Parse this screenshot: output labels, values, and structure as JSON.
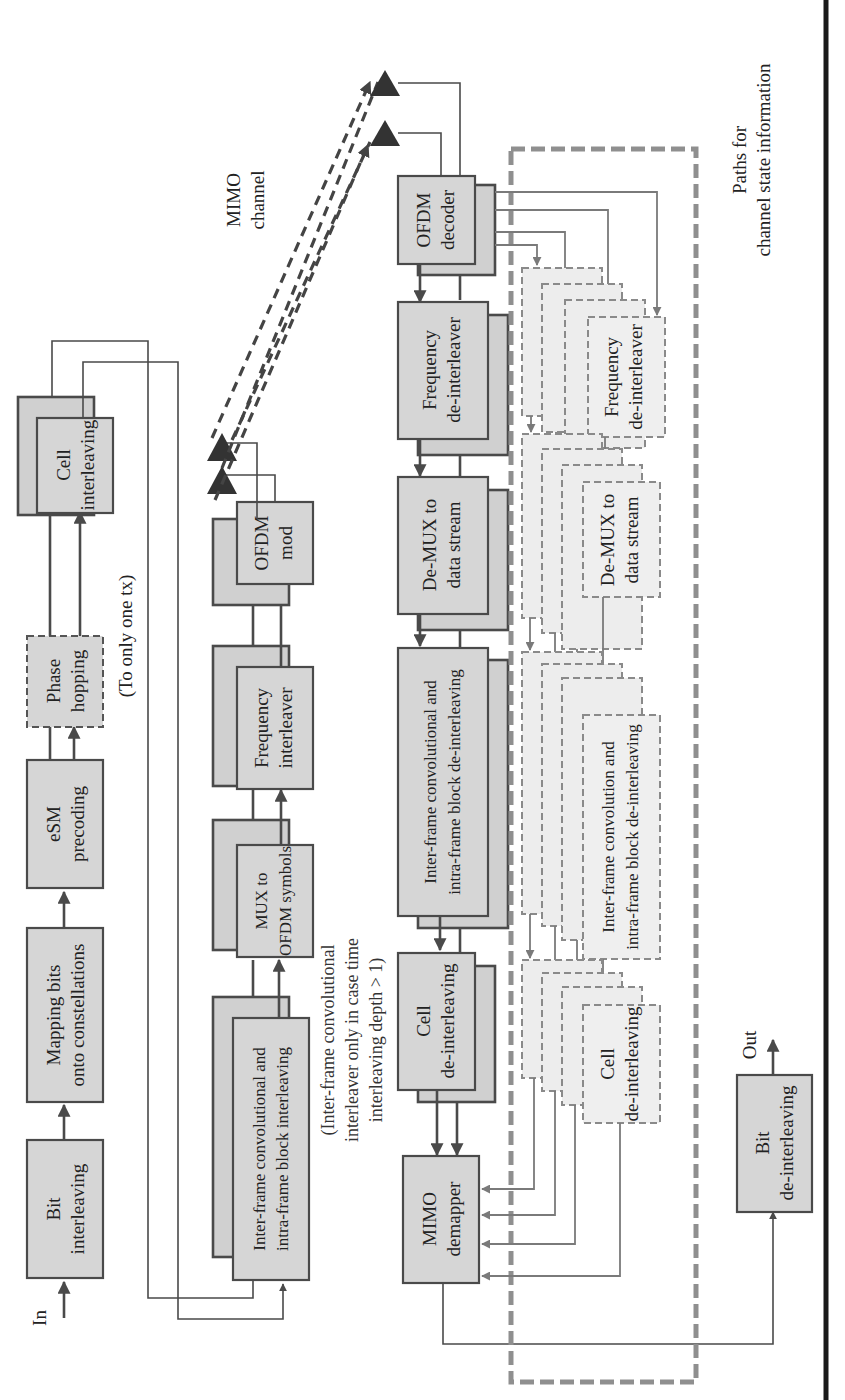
{
  "figure": {
    "orientation": "rotated-90-ccw",
    "transmitter": {
      "input_label": "In",
      "blocks": [
        {
          "id": "bit_interleaving",
          "line1": "Bit",
          "line2": "interleaving"
        },
        {
          "id": "mapping",
          "line1": "Mapping bits",
          "line2": "onto constellations"
        },
        {
          "id": "esm_precoding",
          "line1": "eSM",
          "line2": "precoding"
        },
        {
          "id": "phase_hopping",
          "line1": "Phase",
          "line2": "hopping",
          "style": "dashed"
        },
        {
          "id": "cell_interleaving",
          "line1": "Cell",
          "line2": "interleaving"
        },
        {
          "id": "inter_frame_tx",
          "line1": "Inter-frame convolutional and",
          "line2": "intra-frame block interleaving"
        },
        {
          "id": "mux_ofdm",
          "line1": "MUX to",
          "line2": "OFDM symbols"
        },
        {
          "id": "freq_interleaver",
          "line1": "Frequency",
          "line2": "interleaver"
        },
        {
          "id": "ofdm_mod",
          "line1": "OFDM",
          "line2": "mod"
        }
      ],
      "phase_hopping_note": "(To only one tx)",
      "inter_frame_note": {
        "line1": "(Inter-frame convolutional",
        "line2": "interleaver only in case time",
        "line3": "interleaving depth > 1)"
      }
    },
    "channel": {
      "line1": "MIMO",
      "line2": "channel"
    },
    "receiver": {
      "blocks": [
        {
          "id": "ofdm_decoder",
          "line1": "OFDM",
          "line2": "decoder"
        },
        {
          "id": "freq_deinterleaver",
          "line1": "Frequency",
          "line2": "de-interleaver"
        },
        {
          "id": "demux",
          "line1": "De-MUX to",
          "line2": "data stream"
        },
        {
          "id": "inter_frame_rx",
          "line1": "Inter-frame convolutional and",
          "line2": "intra-frame block de-interleaving"
        },
        {
          "id": "cell_deinterleaving",
          "line1": "Cell",
          "line2": "de-interleaving"
        },
        {
          "id": "mimo_demapper",
          "line1": "MIMO",
          "line2": "demapper"
        },
        {
          "id": "bit_deinterleaving",
          "line1": "Bit",
          "line2": "de-interleaving"
        }
      ],
      "output_label": "Out"
    },
    "csi": {
      "blocks": [
        {
          "id": "csi_freq",
          "line1": "Frequency",
          "line2": "de-interleaver"
        },
        {
          "id": "csi_demux",
          "line1": "De-MUX to",
          "line2": "data stream"
        },
        {
          "id": "csi_inter",
          "line1": "Inter-frame convolution and",
          "line2": "intra-frame block de-interleaving"
        },
        {
          "id": "csi_cell",
          "line1": "Cell",
          "line2": "de-interleaving"
        }
      ],
      "label": {
        "line1": "Paths for",
        "line2": "channel state information"
      }
    },
    "colors": {
      "block_fill": "#d6d6d6",
      "block_stroke": "#4a4a4a",
      "csi_fill": "#ededed",
      "csi_stroke": "#8a8a8a",
      "rule": "#1a1a1a"
    }
  }
}
